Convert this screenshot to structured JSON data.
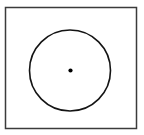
{
  "figure": {
    "title": "Circle inscribed in a square with marked center point",
    "type": "line-diagram",
    "background_color": "#ffffff",
    "canvas": {
      "width": 144,
      "height": 135
    },
    "shapes": {
      "frame": {
        "label": "square frame",
        "kind": "rectangle",
        "x": 5.5,
        "y": 7.5,
        "width": 131,
        "height": 121,
        "stroke_color": "#3b3b3b",
        "stroke_width": 1.5,
        "fill": "none"
      },
      "circle": {
        "label": "circle",
        "kind": "circle",
        "cx": 70,
        "cy": 70.5,
        "r": 40.5,
        "stroke_color": "#141414",
        "stroke_width": 1.6,
        "fill": "none"
      },
      "center_point": {
        "label": "center point",
        "kind": "dot",
        "cx": 70.5,
        "cy": 70.5,
        "r": 2.1,
        "fill_color": "#000000"
      }
    }
  }
}
